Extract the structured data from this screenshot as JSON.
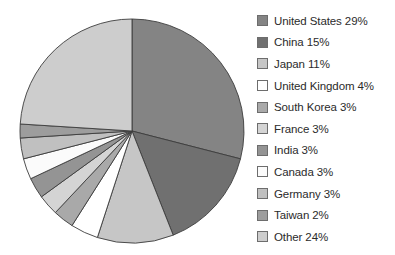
{
  "chart_data": {
    "type": "pie",
    "title": "",
    "start_angle_deg": 0,
    "direction": "clockwise",
    "legend_position": "right",
    "grid": false,
    "unit": "%",
    "categories": [
      "United States",
      "China",
      "Japan",
      "United Kingdom",
      "South Korea",
      "France",
      "India",
      "Canada",
      "Germany",
      "Taiwan",
      "Other"
    ],
    "values": [
      29,
      15,
      11,
      4,
      3,
      3,
      3,
      3,
      3,
      2,
      24
    ],
    "slice_colors": [
      "#848484",
      "#707070",
      "#c6c6c6",
      "#ffffff",
      "#a9a9a9",
      "#d4d4d4",
      "#949494",
      "#fbfbfb",
      "#c0c0c0",
      "#9d9d9d",
      "#cdcdcd"
    ],
    "labels": [
      "United States 29%",
      "China 15%",
      "Japan 11%",
      "United Kingdom 4%",
      "South Korea 3%",
      "France 3%",
      "India 3%",
      "Canada 3%",
      "Germany 3%",
      "Taiwan 2%",
      "Other 24%"
    ]
  },
  "legend": {
    "items": [
      {
        "label": "United States 29%",
        "color": "#848484"
      },
      {
        "label": "China 15%",
        "color": "#707070"
      },
      {
        "label": "Japan 11%",
        "color": "#c6c6c6"
      },
      {
        "label": "United Kingdom 4%",
        "color": "#ffffff"
      },
      {
        "label": "South Korea 3%",
        "color": "#a9a9a9"
      },
      {
        "label": "France 3%",
        "color": "#d4d4d4"
      },
      {
        "label": "India 3%",
        "color": "#949494"
      },
      {
        "label": "Canada 3%",
        "color": "#fbfbfb"
      },
      {
        "label": "Germany 3%",
        "color": "#c0c0c0"
      },
      {
        "label": "Taiwan 2%",
        "color": "#9d9d9d"
      },
      {
        "label": "Other 24%",
        "color": "#cdcdcd"
      }
    ]
  },
  "style": {
    "slice_outline": "#3c3c3c",
    "swatch_outline": "#6d6d6d",
    "text_color": "#2b2b2b",
    "background": "#ffffff"
  }
}
